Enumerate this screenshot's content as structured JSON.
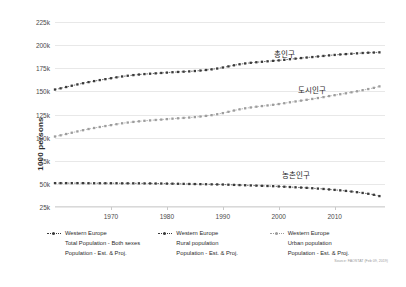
{
  "chart_data": {
    "type": "line",
    "title": "",
    "xlabel": "",
    "ylabel": "1000 persons",
    "xlim": [
      1960,
      2019
    ],
    "ylim": [
      25000,
      225000
    ],
    "grid": true,
    "legend_position": "bottom",
    "ytick_labels": [
      "225k",
      "200k",
      "175k",
      "150k",
      "125k",
      "100k",
      "75k",
      "50k",
      "25k"
    ],
    "ytick_values": [
      225000,
      200000,
      175000,
      150000,
      125000,
      100000,
      75000,
      50000,
      25000
    ],
    "xtick_labels": [
      "1970",
      "1980",
      "1990",
      "2000",
      "2010"
    ],
    "xtick_values": [
      1970,
      1980,
      1990,
      2000,
      2010
    ],
    "x": [
      1960,
      1961,
      1962,
      1963,
      1964,
      1965,
      1966,
      1967,
      1968,
      1969,
      1970,
      1971,
      1972,
      1973,
      1974,
      1975,
      1976,
      1977,
      1978,
      1979,
      1980,
      1981,
      1982,
      1983,
      1984,
      1985,
      1986,
      1987,
      1988,
      1989,
      1990,
      1991,
      1992,
      1993,
      1994,
      1995,
      1996,
      1997,
      1998,
      1999,
      2000,
      2001,
      2002,
      2003,
      2004,
      2005,
      2006,
      2007,
      2008,
      2009,
      2010,
      2011,
      2012,
      2013,
      2014,
      2015,
      2016,
      2017,
      2018
    ],
    "series": [
      {
        "name": "Western Europe Total Population - Both sexes",
        "annotation": "총인구",
        "color": "#3a3a3a",
        "values": [
          152000,
          153300,
          154700,
          156100,
          157500,
          158800,
          160000,
          161100,
          162200,
          163200,
          164200,
          165200,
          166100,
          166900,
          167600,
          168200,
          168700,
          169100,
          169500,
          169900,
          170300,
          170700,
          171000,
          171300,
          171600,
          172000,
          172500,
          173100,
          173800,
          174700,
          175800,
          177000,
          178200,
          179300,
          180200,
          180900,
          181500,
          182000,
          182500,
          183000,
          183500,
          184100,
          184800,
          185400,
          186000,
          186600,
          187100,
          187700,
          188300,
          188900,
          189400,
          189900,
          190300,
          190700,
          191100,
          191500,
          191800,
          192000,
          192200
        ]
      },
      {
        "name": "Western Europe Rural population",
        "annotation": "농촌인구",
        "color": "#3a3a3a",
        "values": [
          50800,
          50800,
          50800,
          50800,
          50800,
          50800,
          50700,
          50700,
          50700,
          50700,
          50700,
          50700,
          50600,
          50600,
          50600,
          50600,
          50500,
          50500,
          50400,
          50400,
          50300,
          50200,
          50100,
          50000,
          49900,
          49800,
          49700,
          49600,
          49500,
          49400,
          49300,
          49100,
          48900,
          48700,
          48500,
          48300,
          48100,
          47900,
          47700,
          47500,
          47200,
          46900,
          46600,
          46300,
          46000,
          45700,
          45300,
          44900,
          44500,
          44000,
          43500,
          43000,
          42400,
          41700,
          41000,
          40200,
          39300,
          38200,
          36800
        ]
      },
      {
        "name": "Western Europe Urban population",
        "annotation": "도시인구",
        "color": "#9d9d9d",
        "values": [
          101200,
          102500,
          103900,
          105300,
          106700,
          108000,
          109300,
          110400,
          111500,
          112500,
          113500,
          114500,
          115500,
          116300,
          117000,
          117600,
          118200,
          118600,
          119100,
          119500,
          120000,
          120500,
          120900,
          121300,
          121700,
          122200,
          122800,
          123500,
          124300,
          125300,
          126500,
          127900,
          129300,
          130600,
          131700,
          132600,
          133400,
          134100,
          134800,
          135500,
          136300,
          137200,
          138200,
          139100,
          140000,
          140900,
          141800,
          142800,
          143800,
          144900,
          145900,
          146900,
          147900,
          149000,
          150100,
          151300,
          152500,
          153800,
          155400
        ]
      }
    ]
  },
  "annotations": [
    {
      "label": "총인구",
      "x": 2001,
      "y": 185500
    },
    {
      "label": "도시인구",
      "x": 2006,
      "y": 146000
    },
    {
      "label": "농촌인구",
      "x": 2003,
      "y": 54500
    }
  ],
  "legend": {
    "entries": [
      {
        "region": "Western Europe",
        "metric": "Total Population - Both sexes",
        "detail": "Population - Est. & Proj.",
        "style": "dark"
      },
      {
        "region": "Western Europe",
        "metric": "Rural population",
        "detail": "Population - Est. & Proj.",
        "style": "dark"
      },
      {
        "region": "Western Europe",
        "metric": "Urban population",
        "detail": "Population - Est. & Proj.",
        "style": "light"
      }
    ]
  },
  "source_note": "Source: FAOSTAT (Feb 09, 2019)"
}
